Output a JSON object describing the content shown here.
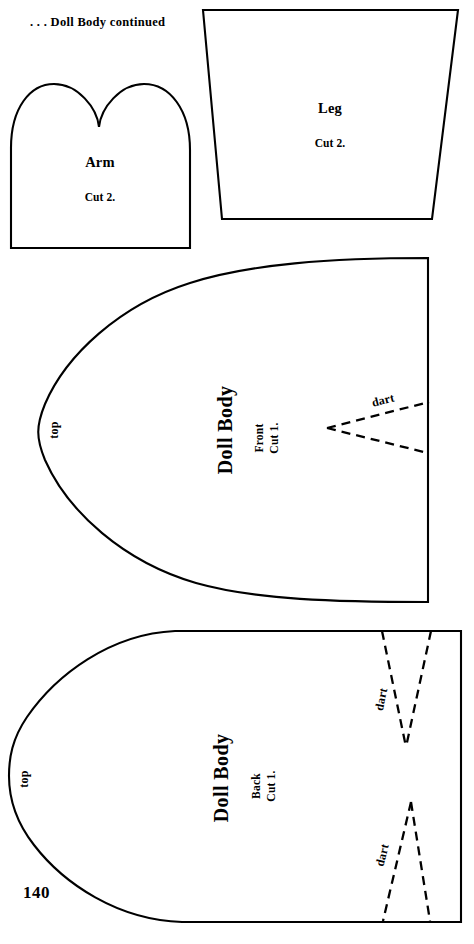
{
  "page": {
    "header": ". . . Doll Body continued",
    "folio": "140",
    "ink_color": "#000000",
    "paper_color": "#ffffff"
  },
  "pieces": [
    {
      "id": "arm",
      "name": "Arm",
      "cut": "Cut 2.",
      "shape": "two-lobed mitten, flat bottom"
    },
    {
      "id": "leg",
      "name": "Leg",
      "cut": "Cut 2.",
      "shape": "trapezoid, wide edge at top"
    },
    {
      "id": "doll-body-front",
      "name": "Doll Body",
      "sub": "Front",
      "cut": "Cut 1.",
      "edge_label": "top",
      "darts": [
        {
          "label": "dart"
        }
      ]
    },
    {
      "id": "doll-body-back",
      "name": "Doll Body",
      "sub": "Back",
      "cut": "Cut 1.",
      "edge_label": "top",
      "darts": [
        {
          "label": "dart"
        },
        {
          "label": "dart"
        }
      ]
    }
  ]
}
